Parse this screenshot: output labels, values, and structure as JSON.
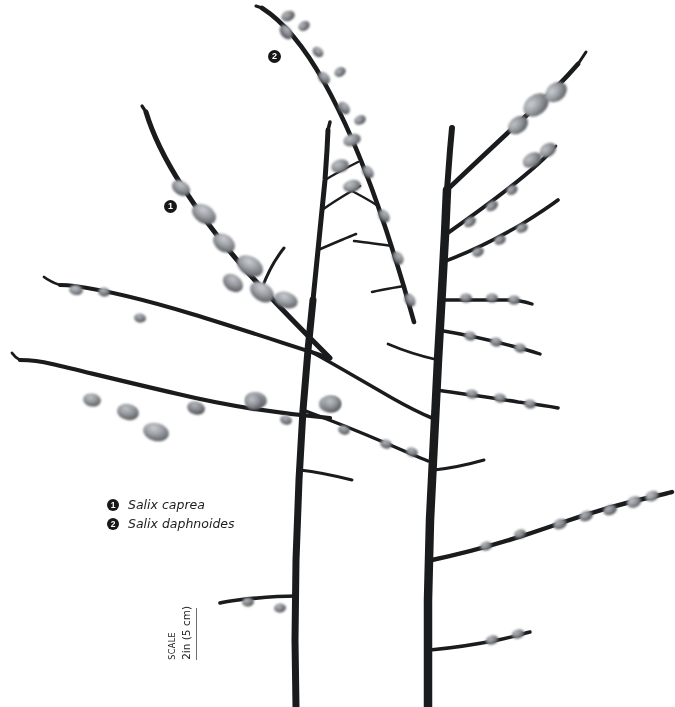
{
  "plate": {
    "background_color": "#ffffff",
    "subject": "pussy willow branches with catkins",
    "ink_color": "#17181a",
    "catkin_color": "#8d9094"
  },
  "markers": [
    {
      "number": "1",
      "x": 164,
      "y": 200,
      "refers_to": "Salix caprea"
    },
    {
      "number": "2",
      "x": 268,
      "y": 50,
      "refers_to": "Salix daphnoides"
    }
  ],
  "legend": {
    "entries": [
      {
        "number": "1",
        "label": "Salix caprea"
      },
      {
        "number": "2",
        "label": "Salix daphnoides"
      }
    ]
  },
  "scale": {
    "caption": "SCALE",
    "value": "2in (5 cm)",
    "rule_color": "#6d6f72"
  }
}
